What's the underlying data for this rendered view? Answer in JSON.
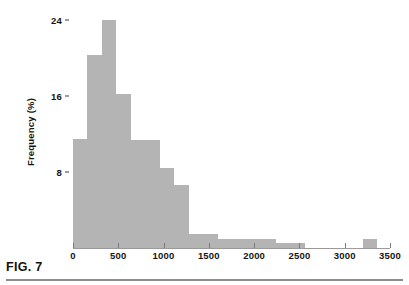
{
  "figure": {
    "caption": "FIG. 7"
  },
  "chart_data": {
    "type": "bar",
    "title": "",
    "subtitle": "",
    "xlabel": "",
    "ylabel": "Frequency (%)",
    "grid": false,
    "legend": null,
    "bar_color": "#b4b4b4",
    "axis_color": "#9a9a9a",
    "xlim": [
      0,
      3600
    ],
    "ylim": [
      0,
      25
    ],
    "xticks": [
      0,
      500,
      1000,
      1500,
      2000,
      2500,
      3000,
      3500
    ],
    "xtick_labels": [
      "0",
      "500",
      "1000",
      "1500",
      "2000",
      "2500",
      "3000",
      "3500"
    ],
    "yticks": [
      8,
      16,
      24
    ],
    "ytick_labels": [
      "8",
      "16",
      "24"
    ],
    "bin_width": 160,
    "bins": [
      {
        "x0": 0,
        "x1": 160,
        "value": 11.5
      },
      {
        "x0": 160,
        "x1": 320,
        "value": 20.3
      },
      {
        "x0": 320,
        "x1": 480,
        "value": 24.0
      },
      {
        "x0": 480,
        "x1": 640,
        "value": 16.2
      },
      {
        "x0": 640,
        "x1": 800,
        "value": 11.4
      },
      {
        "x0": 800,
        "x1": 960,
        "value": 11.4
      },
      {
        "x0": 960,
        "x1": 1120,
        "value": 8.4
      },
      {
        "x0": 1120,
        "x1": 1280,
        "value": 6.6
      },
      {
        "x0": 1280,
        "x1": 1440,
        "value": 1.5
      },
      {
        "x0": 1440,
        "x1": 1600,
        "value": 1.5
      },
      {
        "x0": 1600,
        "x1": 1760,
        "value": 0.9
      },
      {
        "x0": 1760,
        "x1": 1920,
        "value": 0.9
      },
      {
        "x0": 1920,
        "x1": 2080,
        "value": 0.9
      },
      {
        "x0": 2080,
        "x1": 2240,
        "value": 0.9
      },
      {
        "x0": 2240,
        "x1": 2400,
        "value": 0.5
      },
      {
        "x0": 2400,
        "x1": 2560,
        "value": 0.5
      },
      {
        "x0": 2560,
        "x1": 2720,
        "value": 0.0
      },
      {
        "x0": 2720,
        "x1": 2880,
        "value": 0.0
      },
      {
        "x0": 2880,
        "x1": 3040,
        "value": 0.0
      },
      {
        "x0": 3040,
        "x1": 3200,
        "value": 0.0
      },
      {
        "x0": 3200,
        "x1": 3360,
        "value": 0.9
      },
      {
        "x0": 3360,
        "x1": 3520,
        "value": 0.0
      }
    ]
  }
}
